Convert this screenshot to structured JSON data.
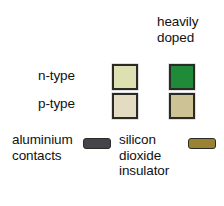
{
  "figure": {
    "kind": "materials-key",
    "background": "#ffffff"
  },
  "header": {
    "heavily_doped": "heavily\ndoped"
  },
  "rows": [
    {
      "label": "n-type",
      "normal_swatch_name": "n-type-swatch",
      "normal_color": "#dde0b0",
      "heavy_swatch_name": "n-type-heavily-doped-swatch",
      "heavy_color": "#1f8a38"
    },
    {
      "label": "p-type",
      "normal_swatch_name": "p-type-swatch",
      "normal_color": "#e3dcc2",
      "heavy_swatch_name": "p-type-heavily-doped-swatch",
      "heavy_color": "#cdc295"
    }
  ],
  "footer": {
    "aluminium_label": "aluminium\ncontacts",
    "aluminium_color": "#44444a",
    "silicon_label": "silicon\ndioxide\ninsulator",
    "silicon_color": "#9b8233"
  },
  "colors": {
    "outline": "#2b2b26",
    "text": "#111111"
  }
}
